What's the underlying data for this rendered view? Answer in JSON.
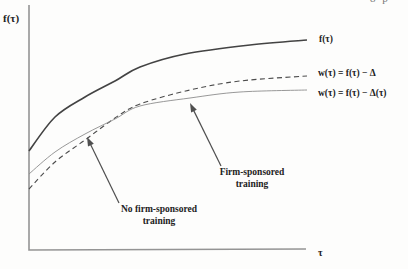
{
  "figure": {
    "header_fragment": "8 p"
  },
  "chart_data": {
    "type": "line",
    "title": "",
    "ylabel": "f(τ)",
    "xlabel": "τ",
    "axes": {
      "numeric_ticks": false,
      "grid": false,
      "color": "#949494",
      "origin_px": [
        29,
        250
      ],
      "x_end_px": [
        306,
        250
      ],
      "y_top_px": [
        29,
        5
      ]
    },
    "series": [
      {
        "name": "f-tau",
        "label": "f(τ)",
        "line": "solid",
        "width": 1.6,
        "color": "#434343",
        "points_px": [
          [
            29,
            151
          ],
          [
            55,
            117
          ],
          [
            85,
            97
          ],
          [
            115,
            81
          ],
          [
            140,
            67
          ],
          [
            185,
            54
          ],
          [
            250,
            45
          ],
          [
            307,
            40
          ]
        ]
      },
      {
        "name": "w-constant-delta",
        "label": "w(τ) = f(τ) − Δ",
        "line": "dashed",
        "width": 1.1,
        "color": "#4c4c4c",
        "points_px": [
          [
            29,
            189
          ],
          [
            55,
            162
          ],
          [
            85,
            140
          ],
          [
            115,
            118
          ],
          [
            140,
            104
          ],
          [
            190,
            90
          ],
          [
            240,
            81
          ],
          [
            307,
            76
          ]
        ]
      },
      {
        "name": "w-delta-of-tau",
        "label": "w(τ) = f(τ) − Δ(τ)",
        "line": "solid-thin",
        "width": 0.9,
        "color": "#8c8c8c",
        "points_px": [
          [
            29,
            174
          ],
          [
            55,
            152
          ],
          [
            85,
            134
          ],
          [
            115,
            119
          ],
          [
            140,
            106
          ],
          [
            190,
            98
          ],
          [
            240,
            92
          ],
          [
            307,
            90
          ]
        ]
      }
    ],
    "annotations": [
      {
        "label": [
          "No firm-sponsored",
          "training"
        ],
        "points_to": "w(τ) = f(τ) − Δ",
        "arrow_from_px": [
          119,
          203
        ],
        "arrow_to_px": [
          87,
          137
        ],
        "arrow_color": "#4f4f4f"
      },
      {
        "label": [
          "Firm-sponsored",
          "training"
        ],
        "points_to": "w(τ) = f(τ) − Δ(τ)",
        "arrow_from_px": [
          221,
          166
        ],
        "arrow_to_px": [
          190,
          103
        ],
        "arrow_color": "#4f4f4f"
      }
    ]
  }
}
